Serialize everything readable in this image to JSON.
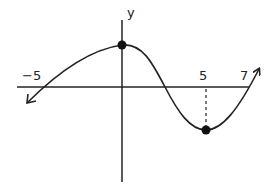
{
  "figure": {
    "type": "function-graph",
    "axes": {
      "y_label": "y",
      "x_tick_labels": [
        {
          "value": -5,
          "text": "−5"
        },
        {
          "value": 5,
          "text": "5"
        },
        {
          "value": 7,
          "text": "7"
        }
      ]
    },
    "key_points": [
      {
        "name": "local-maximum",
        "x": 0,
        "marked": true
      },
      {
        "name": "local-minimum",
        "x": 5,
        "marked": true
      }
    ],
    "x_intercepts": [
      -5,
      2.5,
      7
    ],
    "dashed_guide": {
      "x": 5,
      "from": "x-axis",
      "to": "local-minimum"
    },
    "end_behavior": {
      "left": "arrow down-left",
      "right": "arrow up-right"
    },
    "colors": {
      "curve": "#222222",
      "axes": "#222222",
      "background": "#ffffff"
    }
  }
}
